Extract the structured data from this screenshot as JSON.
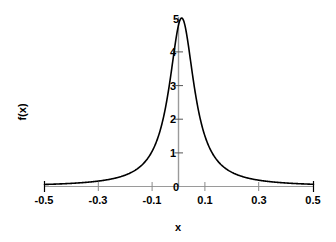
{
  "chart_data": {
    "type": "line",
    "title": "",
    "subtitle": "",
    "xlabel": "x",
    "ylabel": "f(x)",
    "xlim": [
      -0.5,
      0.5
    ],
    "ylim": [
      0,
      5
    ],
    "grid": false,
    "legend": null,
    "curve_color": "#000000",
    "axis_color": "#999999",
    "tick_color": "#000000",
    "x_ticks": [
      -0.5,
      -0.3,
      -0.1,
      0.1,
      0.3,
      0.5
    ],
    "x_tick_labels": [
      "-0.5",
      "-0.3",
      "-0.1",
      "0.1",
      "0.3",
      "0.5"
    ],
    "x_minor_ticks": [
      -0.4,
      -0.2,
      0.0,
      0.2,
      0.4
    ],
    "y_ticks": [
      0,
      1,
      2,
      3,
      4,
      5
    ],
    "y_tick_labels": [
      "0",
      "1",
      "2",
      "3",
      "4",
      "5"
    ],
    "peak": {
      "x": 0.01,
      "y": 5
    },
    "series": [
      {
        "name": "f(x)",
        "color": "#000000",
        "x": [
          -0.5,
          -0.48,
          -0.46,
          -0.44,
          -0.42,
          -0.4,
          -0.38,
          -0.36,
          -0.34,
          -0.32,
          -0.3,
          -0.28,
          -0.26,
          -0.24,
          -0.22,
          -0.2,
          -0.19,
          -0.18,
          -0.17,
          -0.16,
          -0.15,
          -0.14,
          -0.13,
          -0.12,
          -0.11,
          -0.1,
          -0.09,
          -0.08,
          -0.07,
          -0.06,
          -0.05,
          -0.04,
          -0.03,
          -0.02,
          -0.01,
          0.0,
          0.01,
          0.02,
          0.03,
          0.04,
          0.05,
          0.06,
          0.07,
          0.08,
          0.09,
          0.1,
          0.11,
          0.12,
          0.13,
          0.14,
          0.15,
          0.16,
          0.17,
          0.18,
          0.19,
          0.2,
          0.22,
          0.24,
          0.26,
          0.28,
          0.3,
          0.32,
          0.34,
          0.36,
          0.38,
          0.4,
          0.42,
          0.44,
          0.46,
          0.48,
          0.5
        ],
        "y": [
          0.01,
          0.01,
          0.01,
          0.01,
          0.01,
          0.01,
          0.02,
          0.02,
          0.02,
          0.02,
          0.03,
          0.03,
          0.03,
          0.04,
          0.05,
          0.06,
          0.07,
          0.07,
          0.08,
          0.09,
          0.1,
          0.12,
          0.14,
          0.17,
          0.21,
          0.26,
          0.33,
          0.44,
          0.61,
          0.87,
          1.29,
          1.94,
          2.82,
          3.78,
          4.57,
          4.94,
          5.0,
          4.86,
          4.29,
          3.47,
          2.62,
          1.9,
          1.38,
          1.0,
          0.74,
          0.56,
          0.44,
          0.35,
          0.28,
          0.23,
          0.19,
          0.16,
          0.14,
          0.12,
          0.11,
          0.09,
          0.08,
          0.06,
          0.05,
          0.04,
          0.04,
          0.03,
          0.03,
          0.02,
          0.02,
          0.02,
          0.02,
          0.01,
          0.01,
          0.01,
          0.01
        ]
      }
    ]
  },
  "axes": {
    "x_title": "x",
    "y_title": "f(x)"
  },
  "x_tick_labels": {
    "t0": "-0.5",
    "t1": "-0.3",
    "t2": "-0.1",
    "t3": "0.1",
    "t4": "0.3",
    "t5": "0.5"
  },
  "y_tick_labels": {
    "t0": "0",
    "t1": "1",
    "t2": "2",
    "t3": "3",
    "t4": "4",
    "t5": "5"
  }
}
